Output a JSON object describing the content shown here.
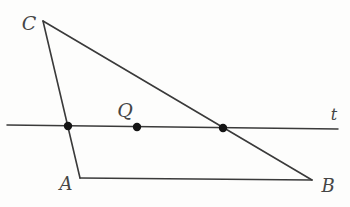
{
  "figure": {
    "width": 350,
    "height": 207,
    "background": "#fdfdfc",
    "stroke_color": "#3a3a3a",
    "label_color": "#454545",
    "dot_color": "#141414",
    "dot_radius": 4.2
  },
  "points": {
    "C": {
      "x": 43,
      "y": 21
    },
    "A": {
      "x": 80,
      "y": 178
    },
    "B": {
      "x": 312,
      "y": 180
    },
    "t_left": {
      "x": 7,
      "y": 125
    },
    "t_right": {
      "x": 338,
      "y": 129
    }
  },
  "segments": [
    {
      "name": "side-CA",
      "from": "C",
      "to": "A",
      "width": 1.6
    },
    {
      "name": "side-CB",
      "from": "C",
      "to": "B",
      "width": 1.6
    },
    {
      "name": "side-AB",
      "from": "A",
      "to": "B",
      "width": 1.6
    },
    {
      "name": "line-t",
      "from": "t_left",
      "to": "t_right",
      "width": 1.5
    }
  ],
  "dots": [
    {
      "name": "intersection-CA-t-dot",
      "x": 68,
      "y": 126
    },
    {
      "name": "point-Q-dot",
      "x": 137,
      "y": 127
    },
    {
      "name": "intersection-CB-t-dot",
      "x": 223,
      "y": 128
    }
  ],
  "labels": [
    {
      "name": "label-C",
      "text": "C",
      "x": 29,
      "y": 23,
      "size": 19
    },
    {
      "name": "label-A",
      "text": "A",
      "x": 66,
      "y": 183,
      "size": 18
    },
    {
      "name": "label-B",
      "text": "B",
      "x": 328,
      "y": 185,
      "size": 18
    },
    {
      "name": "label-Q",
      "text": "Q",
      "x": 125,
      "y": 110,
      "size": 19
    },
    {
      "name": "label-t",
      "text": "t",
      "x": 334,
      "y": 114,
      "size": 16
    }
  ]
}
